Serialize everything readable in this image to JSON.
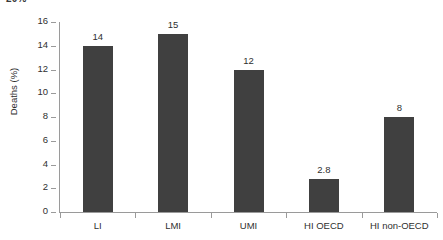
{
  "clipped_title": "20%",
  "chart_data": {
    "type": "bar",
    "title": "",
    "xlabel": "",
    "ylabel": "Deaths (%)",
    "categories": [
      "LI",
      "LMI",
      "UMI",
      "HI OECD",
      "HI non-OECD"
    ],
    "values": [
      14,
      15,
      12,
      2.8,
      8
    ],
    "value_labels": [
      "14",
      "15",
      "12",
      "2.8",
      "8"
    ],
    "ylim": [
      0,
      16
    ],
    "yticks": [
      0,
      2,
      4,
      6,
      8,
      10,
      12,
      14,
      16
    ],
    "ytick_labels": [
      "0",
      "2",
      "4",
      "6",
      "8",
      "10",
      "12",
      "14",
      "16"
    ],
    "grid": false,
    "legend": false,
    "bar_color": "#404040",
    "axis_color": "#9a9a9a",
    "text_color": "#2f2f2f",
    "background": "#ffffff"
  }
}
